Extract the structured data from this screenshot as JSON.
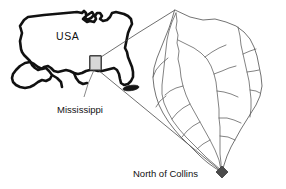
{
  "figure": {
    "type": "map",
    "background_color": "#ffffff",
    "labels": {
      "country": "USA",
      "state": "Mississippi",
      "site": "North of Collins"
    },
    "colors": {
      "country_outline": "#111111",
      "state_outline": "#1a1a1a",
      "inset_box_fill": "#d8d8d8",
      "stream_network": "#5a5a5a",
      "leader_line": "#555555",
      "outlet_marker": "#4b4b4b",
      "text": "#111111"
    },
    "markers": [
      {
        "name": "study-area-box",
        "shape": "rectangle",
        "x": 90,
        "y": 56,
        "width": 11,
        "height": 14
      },
      {
        "name": "site-blob",
        "shape": "ellipse",
        "x": 131,
        "y": 88
      },
      {
        "name": "outlet-marker",
        "shape": "diamond",
        "x": 222,
        "y": 172
      }
    ],
    "label_positions": {
      "country": {
        "x": 56,
        "y": 40
      },
      "state": {
        "x": 57,
        "y": 110
      },
      "site": {
        "x": 133,
        "y": 177
      }
    }
  },
  "geometry": {
    "usa_outline": "M 21 49 L 20 41 L 22 33 L 20 26 L 24 20 L 28 17 L 36 16 L 44 15 L 55 14 L 66 13 L 77 12 L 82 13 L 84 11 L 86 13 L 86 16 L 89 14 L 92 12 L 94 15 L 91 18 L 87 20 L 85 17 L 83 19 L 87 22 L 90 21 L 94 22 L 96 19 L 95 16 L 97 13 L 100 13 L 102 16 L 100 19 L 103 21 L 107 20 L 110 17 L 112 13 L 116 12 L 120 13 L 124 14 L 128 16 L 131 19 L 132 24 L 130 28 L 128 33 L 127 38 L 126 43 L 125 48 L 127 52 L 128 57 L 130 62 L 132 67 L 133 72 L 133 77 L 131 81 L 128 84 L 124 85 L 121 83 L 120 79 L 119 74 L 117 70 L 114 68 L 110 69 L 106 70 L 102 71 L 98 71 L 94 70 L 90 70 L 86 71 L 82 73 L 78 74 L 74 73 L 70 71 L 66 70 L 62 71 L 58 72 L 54 71 L 51 68 L 48 66 L 44 67 L 41 69 L 38 70 L 35 68 L 32 65 L 30 61 L 27 58 L 24 55 L 22 52 Z",
    "gulf_lobe": "M 16 70 L 20 66 L 25 63 L 30 62 L 34 64 L 38 67 L 42 69 L 46 68 L 49 71 L 52 75 L 50 79 L 46 81 L 42 80 L 38 82 L 34 85 L 30 87 L 25 88 L 20 87 L 16 85 L 13 82 L 12 78 L 13 74 Z",
    "basin_outline": "M 175 10 L 190 17 L 203 20 L 215 19 L 226 22 L 236 26 L 244 32 L 250 39 L 254 47 L 257 56 L 259 66 L 261 76 L 262 86 L 260 96 L 256 105 L 251 113 L 246 121 L 241 129 L 236 138 L 231 147 L 227 156 L 224 165 L 222 172 L 215 168 L 208 163 L 201 157 L 194 150 L 187 143 L 180 136 L 174 129 L 168 121 L 163 113 L 159 105 L 156 96 L 154 87 L 153 78 L 154 68 L 157 58 L 161 48 L 165 38 L 169 28 L 172 19 Z"
  },
  "streams": {
    "main_stem": "M 176 13 L 177 21 L 176 28 L 178 35 L 177 43 L 179 51 L 178 59 L 180 68 L 181 77 L 183 86 L 186 95 L 190 104 L 195 113 L 200 122 L 205 131 L 210 140 L 215 150 L 219 160 L 221 170",
    "tributaries": [
      "M 176 13 L 172 22 L 169 31 L 167 40 L 166 49 L 165 58 L 164 67 L 163 76 L 162 85 L 162 94 L 164 103 L 168 112 L 173 121 L 179 129 L 186 137 L 193 144 L 200 151 L 207 158 L 214 164 L 221 170",
      "M 168 58 L 161 64 L 156 70 L 153 77",
      "M 166 96 L 160 101 L 156 107",
      "M 178 40 L 186 44 L 194 48 L 201 53 L 207 59 L 211 66 L 214 74 L 216 82 L 217 91 L 218 100 L 219 109 L 219 118 L 220 127 L 220 136 L 220 145 L 220 154 L 221 163 L 221 170",
      "M 205 57 L 212 52 L 219 48 L 226 45",
      "M 214 74 L 222 71 L 229 68 L 236 66",
      "M 217 91 L 224 92 L 231 94 L 238 97",
      "M 219 118 L 227 118 L 234 120 L 241 123",
      "M 220 136 L 228 137 L 235 140",
      "M 238 27 L 240 36 L 241 45 L 243 54 L 245 63 L 247 72 L 249 81 L 250 90 L 251 99 L 251 108 L 250 117",
      "M 243 54 L 250 51 L 256 49",
      "M 247 72 L 254 71 L 259 70",
      "M 250 90 L 256 91 L 260 93",
      "M 190 104 L 183 108 L 177 113 L 172 119",
      "M 200 122 L 193 126 L 187 131 L 182 137",
      "M 210 140 L 203 144 L 197 149",
      "M 183 86 L 176 88 L 170 91 L 165 95"
    ]
  },
  "leader_lines": {
    "state_callout": "M 94 70 L 88 84 L 84 97",
    "site_callout": "M 131 88 L 119 96 L 108 103",
    "zoom_ray_top": "M 101 57 L 138 33 L 175 10",
    "zoom_ray_bottom": "M 98 70 L 160 121 L 222 172"
  }
}
